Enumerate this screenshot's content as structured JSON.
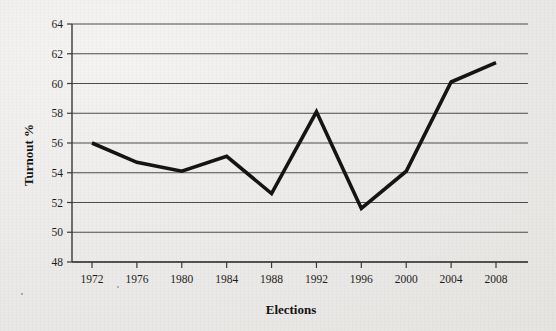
{
  "chart_data": {
    "type": "line",
    "title": "",
    "xlabel": "Elections",
    "ylabel": "Turnout %",
    "categories": [
      "1972",
      "1976",
      "1980",
      "1984",
      "1988",
      "1992",
      "1996",
      "2000",
      "2004",
      "2008"
    ],
    "x": [
      1972,
      1976,
      1980,
      1984,
      1988,
      1992,
      1996,
      2000,
      2004,
      2008
    ],
    "values": [
      56.0,
      54.7,
      54.1,
      55.1,
      52.6,
      58.1,
      51.6,
      54.1,
      60.1,
      61.4
    ],
    "series": [
      {
        "name": "Turnout %",
        "values": [
          56.0,
          54.7,
          54.1,
          55.1,
          52.6,
          58.1,
          51.6,
          54.1,
          60.1,
          61.4
        ]
      }
    ],
    "ylim": [
      48,
      64
    ],
    "yticks": [
      48,
      50,
      52,
      54,
      56,
      58,
      60,
      62,
      64
    ],
    "ytick_labels": [
      "48",
      "50",
      "52",
      "54",
      "56",
      "58",
      "60",
      "62",
      "64"
    ],
    "xtick_labels": [
      "1972",
      "1976",
      "1980",
      "1984",
      "1988",
      "1992",
      "1996",
      "2000",
      "2004",
      "2008"
    ],
    "grid": "horizontal",
    "legend": "none",
    "line_color": "#141414",
    "grid_color": "#4d4d4d",
    "background_color": "#eceae8"
  }
}
